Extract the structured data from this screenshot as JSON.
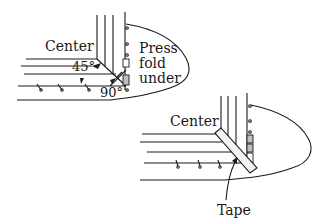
{
  "figure": {
    "top_panel": {
      "center_label": "Center",
      "note_lines": [
        "Press",
        "fold",
        "under"
      ],
      "angle_45_label": "45°",
      "angle_90_label": "90°"
    },
    "bottom_panel": {
      "center_label": "Center",
      "tape_label": "Tape"
    },
    "colors": {
      "ink": "#1a1a1a",
      "background": "#ffffff",
      "tape_fill": "#f2f2f2"
    }
  }
}
